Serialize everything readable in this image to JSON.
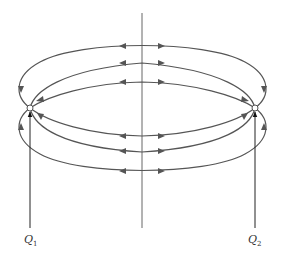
{
  "diagram": {
    "title": "",
    "colors": {
      "lines": "#555555",
      "arrows": "#555555",
      "axis": "#666666",
      "charge_fill": "#ffffff",
      "pointer": "#222222"
    },
    "charges": [
      {
        "id": "Q1",
        "symbol": "Q",
        "subscript": "1",
        "x": 30,
        "y": 108
      },
      {
        "id": "Q2",
        "symbol": "Q",
        "subscript": "2",
        "x": 255,
        "y": 108
      }
    ],
    "axis": {
      "x": 142,
      "y1": 13,
      "y2": 228
    },
    "field_lines": {
      "upper": [
        {
          "apex_y": 46
        },
        {
          "apex_y": 62
        },
        {
          "apex_y": 82
        }
      ],
      "lower": [
        {
          "apex_y": 135
        },
        {
          "apex_y": 151
        },
        {
          "apex_y": 171
        }
      ],
      "arrow_direction_at_axis": "outward from axis toward charges"
    },
    "labels": [
      {
        "text_main": "Q",
        "text_sub": "1"
      },
      {
        "text_main": "Q",
        "text_sub": "2"
      }
    ]
  }
}
